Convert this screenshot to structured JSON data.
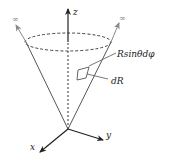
{
  "diagram": {
    "axes": {
      "z_label": "z",
      "y_label": "y",
      "x_label": "x"
    },
    "infinity_labels": [
      "∞",
      "∞"
    ],
    "annotations": {
      "arc_element": "Rsinθdφ",
      "radial_element": "dR"
    },
    "colors": {
      "axis": "#222222",
      "cone": "#555555",
      "extension_arrow": "#888888"
    }
  }
}
